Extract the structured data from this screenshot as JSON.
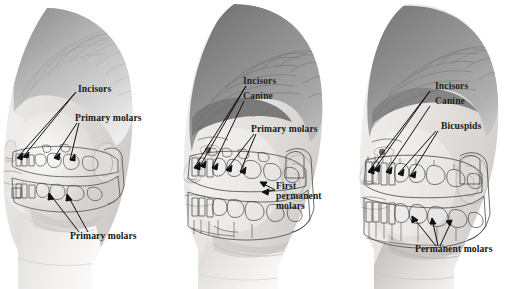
{
  "figure": {
    "background_color": "#ffffff",
    "ink_color": "#151515",
    "panel_count": 3
  },
  "panels": [
    {
      "id": "panel-primary-dentition",
      "subject": "young-child-head-profile",
      "stage": "primary (deciduous) dentition with developing permanent teeth",
      "labels": [
        {
          "name": "incisors",
          "text": "Incisors",
          "x": 78,
          "y": 89,
          "leaders": 2
        },
        {
          "name": "primary-molars-up",
          "text": "Primary molars",
          "x": 75,
          "y": 118,
          "leaders": 2
        },
        {
          "name": "primary-molars-lo",
          "text": "Primary molars",
          "x": 70,
          "y": 236,
          "leaders": 2
        }
      ]
    },
    {
      "id": "panel-mixed-dentition",
      "subject": "school-age-child-head-profile",
      "stage": "mixed dentition with first permanent molars erupted",
      "labels": [
        {
          "name": "incisors",
          "text": "Incisors",
          "x": 243,
          "y": 81,
          "leaders": 2
        },
        {
          "name": "canine",
          "text": "Canine",
          "x": 243,
          "y": 96,
          "leaders": 1
        },
        {
          "name": "primary-molars",
          "text": "Primary molars",
          "x": 251,
          "y": 129,
          "leaders": 2
        },
        {
          "name": "first-permanent-molars",
          "text": "First permanent molars",
          "x": 276,
          "y": 187,
          "leaders": 2,
          "multiline": true
        }
      ]
    },
    {
      "id": "panel-permanent-dentition",
      "subject": "older-child-head-profile",
      "stage": "permanent dentition",
      "labels": [
        {
          "name": "incisors",
          "text": "Incisors",
          "x": 435,
          "y": 86,
          "leaders": 2
        },
        {
          "name": "canine",
          "text": "Canine",
          "x": 435,
          "y": 101,
          "leaders": 1
        },
        {
          "name": "bicuspids",
          "text": "Bicuspids",
          "x": 441,
          "y": 126,
          "leaders": 2
        },
        {
          "name": "permanent-molars",
          "text": "Permanent molars",
          "x": 415,
          "y": 249,
          "leaders": 3
        }
      ]
    }
  ],
  "tooth_types": {
    "incisors": "Incisors",
    "canine": "Canine",
    "bicuspids": "Bicuspids",
    "primary_molars": "Primary molars",
    "first_permanent_molars": "First permanent molars",
    "permanent_molars": "Permanent molars"
  }
}
